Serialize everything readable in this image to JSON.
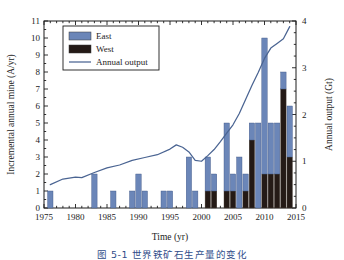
{
  "figure": {
    "caption": "图 5-1  世界铁矿石生产量的变化"
  },
  "chart_data": {
    "type": "bar",
    "title": "",
    "xlabel": "Time (yr)",
    "ylabel": "Incremental annual mine (A/yr)",
    "y2label": "Annual output (Gt)",
    "xlim": [
      1975,
      2015
    ],
    "ylim": [
      0,
      11
    ],
    "y2lim": [
      0,
      4
    ],
    "xticks": [
      1975,
      1980,
      1985,
      1990,
      1995,
      2000,
      2005,
      2010,
      2015
    ],
    "yticks": [
      0,
      1,
      2,
      3,
      4,
      5,
      6,
      7,
      8,
      9,
      10,
      11
    ],
    "y2ticks": [
      0,
      1,
      2,
      3,
      4
    ],
    "grid": false,
    "legend_position": "upper-left",
    "colors": {
      "east": "#6b86b8",
      "west": "#241a16",
      "line": "#4a6492",
      "axis": "#1c1c1c"
    },
    "series": [
      {
        "name": "East",
        "type": "bar",
        "stack": "mine",
        "color": "#6b86b8"
      },
      {
        "name": "West",
        "type": "bar",
        "stack": "mine",
        "color": "#241a16"
      },
      {
        "name": "Annual output",
        "type": "line",
        "axis": "right",
        "color": "#4a6492"
      }
    ],
    "x": [
      1976,
      1983,
      1986,
      1989,
      1990,
      1991,
      1994,
      1995,
      1998,
      1999,
      2001,
      2002,
      2004,
      2005,
      2006,
      2007,
      2008,
      2009,
      2010,
      2011,
      2012,
      2013,
      2014
    ],
    "east_values": [
      1,
      2,
      1,
      1,
      2,
      1,
      1,
      1,
      3,
      1,
      2,
      1,
      4,
      1,
      3,
      1,
      1,
      5,
      8,
      3,
      3,
      1,
      3
    ],
    "west_values": [
      0,
      0,
      0,
      0,
      0,
      0,
      0,
      0,
      0,
      0,
      1,
      1,
      1,
      1,
      0,
      1,
      4,
      0,
      2,
      2,
      2,
      7,
      3
    ],
    "totals": [
      1,
      2,
      1,
      1,
      2,
      1,
      1,
      1,
      3,
      1,
      3,
      2,
      5,
      2,
      3,
      2,
      5,
      5,
      10,
      5,
      5,
      8,
      6
    ],
    "line_x": [
      1976,
      1978,
      1980,
      1981,
      1983,
      1985,
      1987,
      1989,
      1991,
      1993,
      1995,
      1996,
      1997,
      1998,
      1999,
      2000,
      2001,
      2002,
      2003,
      2004,
      2005,
      2006,
      2007,
      2008,
      2009,
      2010,
      2011,
      2012,
      2013,
      2014
    ],
    "line_y": [
      0.5,
      0.62,
      0.66,
      0.65,
      0.76,
      0.86,
      0.92,
      1.02,
      1.08,
      1.14,
      1.26,
      1.35,
      1.3,
      1.2,
      1.02,
      1.0,
      1.12,
      1.25,
      1.42,
      1.6,
      1.78,
      2.02,
      2.32,
      2.62,
      2.9,
      3.2,
      3.42,
      3.52,
      3.62,
      3.88
    ]
  },
  "legend": {
    "items": [
      {
        "label": "East",
        "marker": "bar-swatch-blue"
      },
      {
        "label": "West",
        "marker": "bar-swatch-black"
      },
      {
        "label": "Annual output",
        "marker": "line-swatch"
      }
    ]
  }
}
